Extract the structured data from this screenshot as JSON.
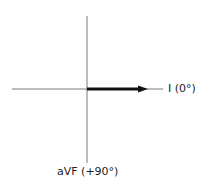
{
  "diagram": {
    "type": "hexaxial-reference-axes",
    "axes": {
      "horizontal": {
        "label": "I (0°)",
        "angle_deg": 0
      },
      "vertical": {
        "label": "aVF (+90°)",
        "angle_deg": 90
      }
    },
    "vector": {
      "direction": "lead I",
      "angle_deg": 0
    },
    "colors": {
      "axis": "#7a7a7a",
      "vector": "#111111",
      "text": "#222222"
    }
  }
}
